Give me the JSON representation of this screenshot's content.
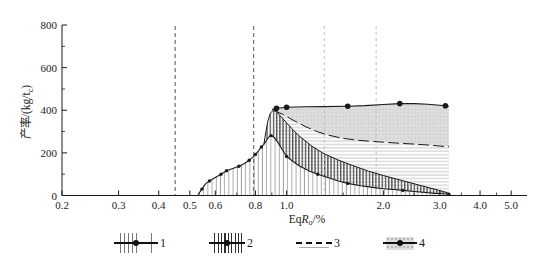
{
  "chart_data": {
    "type": "area",
    "title": "",
    "x_scale": "log",
    "xlim": [
      0.2,
      5.6
    ],
    "ylim": [
      0,
      800
    ],
    "xlabel": {
      "prefix": "Eq",
      "symbol": "R",
      "subscript": "o",
      "suffix": "/%",
      "display": "EqRo/%"
    },
    "ylabel": {
      "prefix": "产率/(kg/t",
      "subscript": "c",
      "suffix": ")",
      "display": "产率/(kg/tc)"
    },
    "x_ticks": {
      "values": [
        0.2,
        0.3,
        0.4,
        0.5,
        0.6,
        0.8,
        1.0,
        2.0,
        3.0,
        4.0,
        5.0
      ],
      "labels": [
        "0.2",
        "0.3",
        "0.4",
        "0.5",
        "0.6",
        "0.8",
        "1.0",
        "2.0",
        "3.0",
        "4.0",
        "5.0"
      ],
      "minor": [
        0.7,
        0.9,
        1.5,
        2.5,
        3.5,
        4.5
      ]
    },
    "y_ticks": {
      "values": [
        0,
        200,
        400,
        600,
        800
      ],
      "labels": [
        "0",
        "200",
        "400",
        "600",
        "800"
      ],
      "minor": [
        100,
        300,
        500,
        700
      ]
    },
    "grid": "off",
    "vlines": [
      {
        "x": 0.45,
        "color": "#555555",
        "dash": "4 3",
        "width": 1
      },
      {
        "x": 0.79,
        "color": "#555555",
        "dash": "4 3",
        "width": 1
      },
      {
        "x": 1.31,
        "color": "#bbbbbb",
        "dash": "3 3",
        "width": 0.9
      },
      {
        "x": 1.9,
        "color": "#bbbbbb",
        "dash": "3 3",
        "width": 0.9
      }
    ],
    "curves": {
      "A": {
        "width": 1.1,
        "points": [
          [
            0.53,
            4
          ],
          [
            0.545,
            30
          ],
          [
            0.56,
            56
          ],
          [
            0.575,
            68
          ],
          [
            0.6,
            84
          ],
          [
            0.625,
            100
          ],
          [
            0.65,
            116
          ],
          [
            0.68,
            127
          ],
          [
            0.71,
            137
          ],
          [
            0.74,
            150
          ],
          [
            0.765,
            165
          ],
          [
            0.785,
            180
          ],
          [
            0.8,
            193
          ],
          [
            0.82,
            212
          ],
          [
            0.835,
            228
          ],
          [
            0.85,
            240
          ],
          [
            0.865,
            258
          ],
          [
            0.88,
            274
          ],
          [
            0.895,
            281
          ],
          [
            0.915,
            272
          ],
          [
            0.94,
            248
          ],
          [
            0.97,
            215
          ],
          [
            1.0,
            183
          ],
          [
            1.05,
            158
          ],
          [
            1.1,
            137
          ],
          [
            1.18,
            114
          ],
          [
            1.25,
            100
          ],
          [
            1.35,
            83
          ],
          [
            1.45,
            68
          ],
          [
            1.55,
            57
          ],
          [
            1.7,
            46
          ],
          [
            1.85,
            38
          ],
          [
            2.0,
            32
          ],
          [
            2.15,
            28
          ],
          [
            2.3,
            24
          ],
          [
            2.5,
            19
          ],
          [
            2.7,
            14
          ],
          [
            2.9,
            10
          ],
          [
            3.05,
            8
          ],
          [
            3.2,
            6
          ]
        ],
        "markers": [
          [
            0.545,
            30
          ],
          [
            0.575,
            68
          ],
          [
            0.625,
            100
          ],
          [
            0.65,
            116
          ],
          [
            0.71,
            137
          ],
          [
            0.765,
            165
          ],
          [
            0.8,
            193
          ],
          [
            0.835,
            228
          ],
          [
            0.895,
            281
          ],
          [
            1.0,
            183
          ],
          [
            1.25,
            100
          ],
          [
            1.55,
            57
          ],
          [
            2.3,
            24
          ],
          [
            3.2,
            6
          ]
        ],
        "marker_r": 1.7
      },
      "B": {
        "width": 1.0,
        "points": [
          [
            0.85,
            240
          ],
          [
            0.862,
            300
          ],
          [
            0.875,
            352
          ],
          [
            0.89,
            385
          ],
          [
            0.905,
            398
          ],
          [
            0.925,
            396
          ],
          [
            0.95,
            378
          ],
          [
            1.0,
            341
          ],
          [
            1.05,
            306
          ],
          [
            1.1,
            277
          ],
          [
            1.2,
            231
          ],
          [
            1.3,
            198
          ],
          [
            1.45,
            166
          ],
          [
            1.6,
            141
          ],
          [
            1.8,
            114
          ],
          [
            2.0,
            94
          ],
          [
            2.2,
            77
          ],
          [
            2.4,
            62
          ],
          [
            2.6,
            48
          ],
          [
            2.8,
            35
          ],
          [
            3.0,
            23
          ],
          [
            3.1,
            17
          ],
          [
            3.2,
            10
          ]
        ]
      },
      "C": {
        "width": 1.0,
        "dash": "11 4",
        "points": [
          [
            0.915,
            399
          ],
          [
            0.97,
            382
          ],
          [
            1.02,
            363
          ],
          [
            1.08,
            343
          ],
          [
            1.15,
            322
          ],
          [
            1.25,
            299
          ],
          [
            1.35,
            283
          ],
          [
            1.5,
            268
          ],
          [
            1.65,
            260
          ],
          [
            1.8,
            255
          ],
          [
            2.0,
            250
          ],
          [
            2.2,
            246
          ],
          [
            2.5,
            241
          ],
          [
            2.8,
            236
          ],
          [
            3.0,
            232
          ],
          [
            3.2,
            229
          ]
        ]
      },
      "D": {
        "width": 1.1,
        "points": [
          [
            0.9,
            403
          ],
          [
            0.93,
            409
          ],
          [
            1.0,
            414
          ],
          [
            1.15,
            416
          ],
          [
            1.3,
            417
          ],
          [
            1.55,
            419
          ],
          [
            1.75,
            422
          ],
          [
            2.0,
            427
          ],
          [
            2.25,
            431
          ],
          [
            2.5,
            431
          ],
          [
            2.75,
            428
          ],
          [
            3.0,
            423
          ],
          [
            3.2,
            419
          ]
        ],
        "markers": [
          [
            0.93,
            409
          ],
          [
            1.0,
            414
          ],
          [
            1.55,
            419
          ],
          [
            2.25,
            431
          ],
          [
            3.12,
            421
          ]
        ],
        "marker_r": 2.8
      }
    },
    "regions": [
      {
        "id": "4",
        "fill": "gray-dots",
        "top": "D",
        "bottom": "C"
      },
      {
        "id": "3",
        "fill": "hhatch",
        "top": "C",
        "bottom": "A",
        "from_x": 0.915
      },
      {
        "id": "2",
        "fill": "vhatch-dense",
        "top": "B",
        "bottom": "A",
        "from_x": 0.85
      },
      {
        "id": "1",
        "fill": "vhatch-thin",
        "top": "A",
        "bottom": "axis"
      }
    ],
    "legend": {
      "position": "bottom",
      "items": [
        {
          "label": "1",
          "swatch": "vertical-hatch-thin-with-line-dot"
        },
        {
          "label": "2",
          "swatch": "vertical-hatch-dense-with-line-dot"
        },
        {
          "label": "3",
          "swatch": "horizontal-lines-with-dashed-line"
        },
        {
          "label": "4",
          "swatch": "gray-dotted-fill-with-line-dot"
        }
      ]
    },
    "colors": {
      "line": "#1a1a1a",
      "hatch_thin": "#777777",
      "hatch_dense": "#2f2f2f",
      "hatch_horiz": "#aaaaaa",
      "area_gray": "#dddddd",
      "area_dot": "#b5b5b5"
    }
  }
}
